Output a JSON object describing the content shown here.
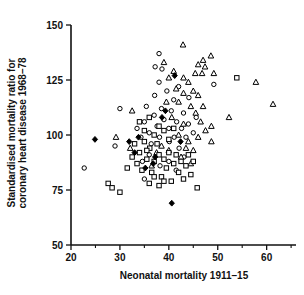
{
  "figure": {
    "background": "#ffffff",
    "ink_color": "#111111"
  },
  "chart_data": {
    "type": "scatter",
    "title": "",
    "xlabel": "Neonatal mortality 1911–15",
    "ylabel_line1": "Standardised mortality ratio for",
    "ylabel_line2": "coronary heart disease 1968–78",
    "xlim": [
      20,
      66
    ],
    "ylim": [
      50,
      150
    ],
    "x_major_ticks": [
      20,
      30,
      40,
      50,
      60
    ],
    "x_minor_ticks": [
      25,
      35,
      45,
      55,
      65
    ],
    "y_major_ticks": [
      50,
      75,
      100,
      125,
      150
    ],
    "grid": false,
    "legend_position": "none",
    "marker_color": "#000000",
    "layout_hints": {
      "plot_left": 71,
      "plot_right": 296,
      "plot_top": 25,
      "plot_bottom": 245
    },
    "series": [
      {
        "name": "open-circle",
        "marker": "circle",
        "filled": false,
        "points": [
          [
            22.7,
            85
          ],
          [
            29.0,
            95
          ],
          [
            30.0,
            112
          ],
          [
            37.2,
            131
          ],
          [
            38.6,
            130
          ],
          [
            38.0,
            137
          ],
          [
            49.2,
            123
          ],
          [
            33.5,
            103
          ],
          [
            34.3,
            99
          ],
          [
            35.0,
            106
          ],
          [
            35.4,
            113
          ],
          [
            36.0,
            101
          ],
          [
            36.4,
            96
          ],
          [
            37.0,
            109
          ],
          [
            37.1,
            118
          ],
          [
            37.6,
            104
          ],
          [
            38.1,
            99
          ],
          [
            38.0,
            124
          ],
          [
            38.5,
            112
          ],
          [
            39.0,
            107
          ],
          [
            39.6,
            120
          ],
          [
            40.0,
            103
          ],
          [
            40.1,
            97
          ],
          [
            40.5,
            111
          ],
          [
            41.0,
            116
          ],
          [
            41.1,
            99
          ],
          [
            41.6,
            106
          ],
          [
            42.0,
            122
          ],
          [
            42.1,
            94
          ],
          [
            42.6,
            103
          ],
          [
            43.0,
            110
          ],
          [
            43.5,
            99
          ],
          [
            44.0,
            105
          ],
          [
            44.1,
            117
          ],
          [
            45.0,
            101
          ],
          [
            45.6,
            108
          ],
          [
            40.0,
            88
          ],
          [
            38.2,
            86
          ],
          [
            36.0,
            91
          ],
          [
            34.6,
            88
          ],
          [
            41.5,
            84
          ],
          [
            43.1,
            90
          ],
          [
            35.0,
            80
          ]
        ]
      },
      {
        "name": "open-triangle",
        "marker": "triangle",
        "filled": false,
        "points": [
          [
            32.5,
            111
          ],
          [
            29.2,
            99
          ],
          [
            32.1,
            94
          ],
          [
            42.9,
            141
          ],
          [
            47.0,
            134
          ],
          [
            46.0,
            132
          ],
          [
            47.4,
            131
          ],
          [
            45.4,
            128
          ],
          [
            46.8,
            128
          ],
          [
            61.3,
            114
          ],
          [
            57.8,
            124
          ],
          [
            48.6,
            136
          ],
          [
            49.2,
            128
          ],
          [
            52.3,
            108
          ],
          [
            48.7,
            104
          ],
          [
            48.7,
            97
          ],
          [
            39.0,
            133
          ],
          [
            41.0,
            129
          ],
          [
            43.0,
            126
          ],
          [
            44.0,
            124
          ],
          [
            45.0,
            120
          ],
          [
            46.0,
            118
          ],
          [
            44.5,
            113
          ],
          [
            45.5,
            110
          ],
          [
            46.5,
            106
          ],
          [
            47.0,
            113
          ],
          [
            43.0,
            119
          ],
          [
            42.0,
            115
          ],
          [
            40.0,
            126
          ],
          [
            41.5,
            121
          ],
          [
            44.0,
            97
          ],
          [
            45.0,
            93
          ],
          [
            46.0,
            99
          ],
          [
            43.5,
            94
          ],
          [
            42.5,
            90
          ],
          [
            44.5,
            87
          ],
          [
            39.5,
            115
          ],
          [
            40.6,
            108
          ],
          [
            38.5,
            95
          ],
          [
            37.5,
            92
          ],
          [
            36.5,
            86
          ],
          [
            40.0,
            93
          ],
          [
            47.5,
            102
          ],
          [
            42.0,
            100
          ],
          [
            43.0,
            105
          ]
        ]
      },
      {
        "name": "open-square",
        "marker": "square",
        "filled": false,
        "points": [
          [
            27.6,
            78
          ],
          [
            28.4,
            76
          ],
          [
            30.0,
            74
          ],
          [
            53.9,
            126
          ],
          [
            45.8,
            76
          ],
          [
            33.0,
            96
          ],
          [
            34.0,
            92
          ],
          [
            34.5,
            84
          ],
          [
            35.0,
            97
          ],
          [
            35.5,
            89
          ],
          [
            36.1,
            94
          ],
          [
            36.5,
            83
          ],
          [
            37.0,
            88
          ],
          [
            37.6,
            96
          ],
          [
            38.0,
            91
          ],
          [
            38.5,
            81
          ],
          [
            39.0,
            89
          ],
          [
            39.5,
            85
          ],
          [
            40.0,
            92
          ],
          [
            40.5,
            79
          ],
          [
            41.0,
            87
          ],
          [
            41.5,
            91
          ],
          [
            42.0,
            83
          ],
          [
            42.5,
            88
          ],
          [
            43.0,
            80
          ],
          [
            43.5,
            86
          ],
          [
            44.0,
            91
          ],
          [
            44.5,
            82
          ],
          [
            45.0,
            88
          ],
          [
            36.0,
            78
          ],
          [
            37.0,
            81
          ],
          [
            38.0,
            77
          ],
          [
            39.0,
            79
          ],
          [
            33.5,
            87
          ],
          [
            32.5,
            90
          ],
          [
            31.5,
            85
          ],
          [
            34.0,
            106
          ],
          [
            35.0,
            102
          ],
          [
            36.0,
            108
          ],
          [
            37.0,
            100
          ],
          [
            39.0,
            102
          ],
          [
            40.0,
            98
          ],
          [
            38.0,
            104
          ],
          [
            41.0,
            103
          ],
          [
            35.5,
            93
          ]
        ]
      },
      {
        "name": "filled-diamond",
        "marker": "diamond",
        "filled": true,
        "points": [
          [
            24.9,
            98
          ],
          [
            31.9,
            97
          ],
          [
            40.6,
            69
          ],
          [
            33.8,
            99
          ],
          [
            36.8,
            87
          ],
          [
            38.6,
            108
          ],
          [
            42.4,
            97
          ],
          [
            41.2,
            127
          ],
          [
            39.3,
            111
          ],
          [
            33.0,
            92
          ],
          [
            35.2,
            85
          ],
          [
            37.2,
            90
          ]
        ]
      }
    ]
  }
}
